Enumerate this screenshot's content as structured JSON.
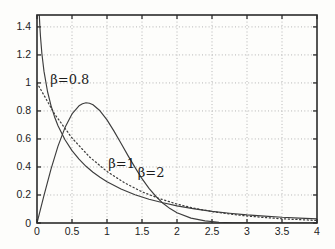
{
  "figure": {
    "background": "#fdfdfb",
    "frame_color": "#2b2b2b",
    "grid_color": "#b4b4b4",
    "curve_color": "#3d3d3d",
    "text_color": "#1c1c1c"
  },
  "chart_data": {
    "type": "line",
    "title": "",
    "subtitle": "",
    "xlabel": "",
    "ylabel": "",
    "xlim": [
      0,
      4
    ],
    "ylim": [
      0,
      1.485
    ],
    "grid": true,
    "legend_position": "none",
    "xticks": [
      0,
      0.5,
      1,
      1.5,
      2,
      2.5,
      3,
      3.5,
      4
    ],
    "xtick_labels": [
      "0",
      "0.5",
      "1",
      "1.5",
      "2",
      "2.5",
      "3",
      "3.5",
      "4"
    ],
    "yticks": [
      0,
      0.2,
      0.4,
      0.6,
      0.8,
      1,
      1.2,
      1.4
    ],
    "ytick_labels": [
      "0",
      "0.2",
      "0.4",
      "0.6",
      "0.8",
      "1",
      "1.2",
      "1.4"
    ],
    "series": [
      {
        "id": "beta-0-8",
        "name": "β=0.8",
        "style": "solid",
        "formula": "Weibull pdf, shape 0.8, scale 1",
        "points": [
          [
            0.01,
            1.96
          ],
          [
            0.02,
            1.674
          ],
          [
            0.03,
            1.518
          ],
          [
            0.04,
            1.411
          ],
          [
            0.05,
            1.33
          ],
          [
            0.07,
            1.209
          ],
          [
            0.1,
            1.082
          ],
          [
            0.15,
            0.939
          ],
          [
            0.2,
            0.838
          ],
          [
            0.25,
            0.759
          ],
          [
            0.3,
            0.695
          ],
          [
            0.4,
            0.594
          ],
          [
            0.5,
            0.517
          ],
          [
            0.6,
            0.456
          ],
          [
            0.7,
            0.405
          ],
          [
            0.8,
            0.362
          ],
          [
            0.9,
            0.326
          ],
          [
            1,
            0.294
          ],
          [
            1.2,
            0.243
          ],
          [
            1.4,
            0.202
          ],
          [
            1.6,
            0.17
          ],
          [
            1.8,
            0.144
          ],
          [
            2,
            0.122
          ],
          [
            2.25,
            0.101
          ],
          [
            2.5,
            0.083
          ],
          [
            2.75,
            0.069
          ],
          [
            3,
            0.058
          ],
          [
            3.25,
            0.049
          ],
          [
            3.5,
            0.041
          ],
          [
            3.75,
            0.035
          ],
          [
            4,
            0.029
          ]
        ]
      },
      {
        "id": "beta-1",
        "name": "β=1",
        "style": "dotted",
        "formula": "Weibull pdf, shape 1, scale 1 (exponential)",
        "points": [
          [
            0,
            1
          ],
          [
            0.25,
            0.779
          ],
          [
            0.5,
            0.607
          ],
          [
            0.75,
            0.472
          ],
          [
            1,
            0.368
          ],
          [
            1.25,
            0.287
          ],
          [
            1.5,
            0.223
          ],
          [
            1.75,
            0.174
          ],
          [
            2,
            0.135
          ],
          [
            2.25,
            0.105
          ],
          [
            2.5,
            0.082
          ],
          [
            2.75,
            0.064
          ],
          [
            3,
            0.05
          ],
          [
            3.25,
            0.039
          ],
          [
            3.5,
            0.03
          ],
          [
            3.75,
            0.024
          ],
          [
            4,
            0.018
          ]
        ]
      },
      {
        "id": "beta-2",
        "name": "β=2",
        "style": "solid",
        "formula": "Weibull pdf, shape 2, scale 1 (Rayleigh)",
        "points": [
          [
            0,
            0
          ],
          [
            0.1,
            0.198
          ],
          [
            0.2,
            0.384
          ],
          [
            0.3,
            0.549
          ],
          [
            0.4,
            0.681
          ],
          [
            0.5,
            0.779
          ],
          [
            0.6,
            0.837
          ],
          [
            0.65,
            0.852
          ],
          [
            0.7,
            0.858
          ],
          [
            0.75,
            0.855
          ],
          [
            0.8,
            0.844
          ],
          [
            0.9,
            0.801
          ],
          [
            1,
            0.736
          ],
          [
            1.1,
            0.656
          ],
          [
            1.2,
            0.569
          ],
          [
            1.3,
            0.481
          ],
          [
            1.4,
            0.397
          ],
          [
            1.5,
            0.316
          ],
          [
            1.6,
            0.247
          ],
          [
            1.7,
            0.189
          ],
          [
            1.8,
            0.141
          ],
          [
            1.9,
            0.103
          ],
          [
            2,
            0.073
          ],
          [
            2.2,
            0.035
          ],
          [
            2.4,
            0.015
          ],
          [
            2.6,
            0.006
          ],
          [
            2.8,
            0.002
          ],
          [
            3,
            0.001
          ],
          [
            3.5,
            0
          ],
          [
            4,
            0
          ]
        ]
      }
    ],
    "annotations": [
      {
        "text": "β=0.8",
        "x": 0.19,
        "y": 1.02,
        "anchor": "start"
      },
      {
        "text": "β=1",
        "x": 1.21,
        "y": 0.42,
        "anchor": "middle"
      },
      {
        "text": "β=2",
        "x": 1.63,
        "y": 0.36,
        "anchor": "middle"
      }
    ]
  }
}
